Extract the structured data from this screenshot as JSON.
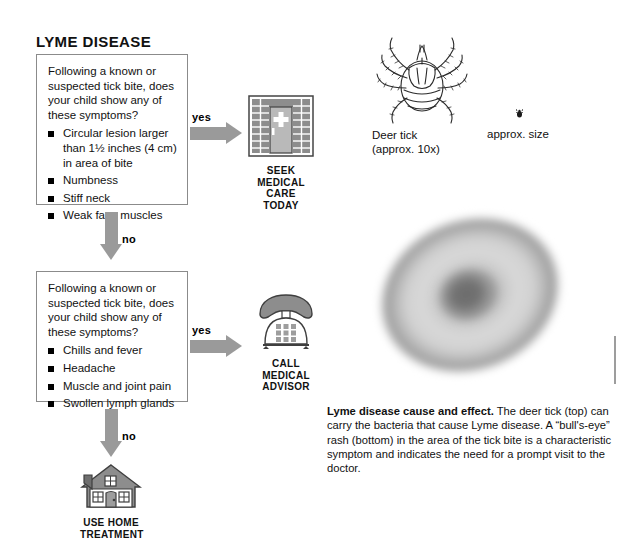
{
  "page_title": "LYME DISEASE",
  "flow": {
    "steps": [
      {
        "question": "Following a known or suspected tick bite, does your child show any of these symptoms?",
        "symptoms": [
          "Circular lesion larger than 1½ inches (4 cm) in area of bite",
          "Numbness",
          "Stiff neck",
          "Weak face muscles"
        ],
        "yes_label": "yes",
        "no_label": "no",
        "outcome": {
          "icon": "hospital-building-icon",
          "caption": "SEEK\nMEDICAL\nCARE TODAY",
          "caption_lines": [
            "SEEK",
            "MEDICAL",
            "CARE TODAY"
          ]
        }
      },
      {
        "question": "Following a known or suspected tick bite, does your child show any of these symptoms?",
        "symptoms": [
          "Chills and fever",
          "Headache",
          "Muscle and joint pain",
          "Swollen lymph glands"
        ],
        "yes_label": "yes",
        "no_label": "no",
        "outcome": {
          "icon": "telephone-icon",
          "caption": "CALL\nMEDICAL\nADVISOR",
          "caption_lines": [
            "CALL",
            "MEDICAL",
            "ADVISOR"
          ]
        }
      }
    ],
    "final_outcome": {
      "icon": "house-icon",
      "caption_lines": [
        "USE HOME",
        "TREATMENT"
      ]
    }
  },
  "illustration": {
    "tick_label_line1": "Deer tick",
    "tick_label_line2": "(approx. 10x)",
    "approx_size_label": "approx. size",
    "caption_bold": "Lyme disease cause and effect.",
    "caption_body": " The deer tick (top) can carry the bacteria that cause Lyme disease. A “bull's-eye” rash (bottom) in the area of the tick bite is a characteristic symptom and indicates the need for a prompt visit to the doctor."
  },
  "colors": {
    "arrow_gray": "#9a9a9a",
    "box_border": "#8b8b8b",
    "rash_outer": "#8e8e8e",
    "rash_inner_ring": "#d6d6d6",
    "rash_center": "#6f6f6f",
    "text": "#111111"
  }
}
